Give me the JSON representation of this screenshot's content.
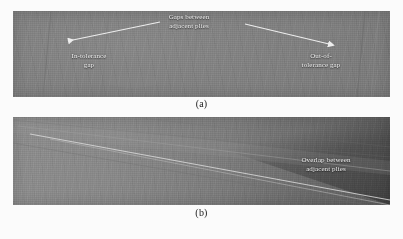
{
  "figure": {
    "background_color": "#fbfbfb",
    "width": 403,
    "height": 239,
    "type": "two-panel micrograph figure of composite ply layup defects"
  },
  "panel_a": {
    "caption": "(a)",
    "surface_color": "#7e7e7e",
    "annotation_text_color": "#f2f2f2",
    "labels": {
      "center": "Gaps between\nadjacent plies",
      "left": "In-tolerance\ngap",
      "right": "Out-of-\ntolerance gap"
    },
    "arrows": [
      {
        "name": "arrow-to-in-tolerance-gap",
        "direction": "left",
        "from_x": 160,
        "from_y": 22,
        "to_x": 61,
        "to_y": 41,
        "color": "#ededed"
      },
      {
        "name": "arrow-to-out-of-tolerance-gap",
        "direction": "right",
        "from_x": 245,
        "from_y": 24,
        "to_x": 336,
        "to_y": 44,
        "color": "#ededed"
      }
    ]
  },
  "panel_b": {
    "caption": "(b)",
    "surface_color_light": "#8c8c8c",
    "surface_color_dark": "#5c5c5c",
    "annotation_text_color": "#f2f2f2",
    "labels": {
      "right": "Overlap between\nadjacent plies"
    },
    "ply_boundaries": [
      {
        "name": "upper-ply-edge",
        "x1": 18,
        "y1": 126,
        "x2": 390,
        "y2": 171
      },
      {
        "name": "overlap-seam",
        "x1": 30,
        "y1": 134,
        "x2": 390,
        "y2": 200
      },
      {
        "name": "lower-ply-edge",
        "x1": 50,
        "y1": 139,
        "x2": 390,
        "y2": 205
      }
    ]
  }
}
